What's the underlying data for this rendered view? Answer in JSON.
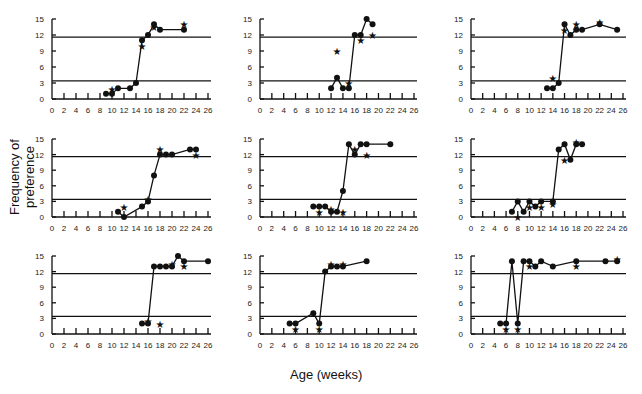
{
  "chart_data": {
    "type": "line",
    "layout": "3x3 small multiples",
    "xlabel": "Age    (weeks)",
    "ylabel": "Frequency  of  preference",
    "x_ticks": [
      0,
      2,
      4,
      6,
      8,
      10,
      12,
      14,
      16,
      18,
      20,
      22,
      24,
      26
    ],
    "y_ticks": [
      0,
      3,
      6,
      9,
      12,
      15
    ],
    "xlim": [
      0,
      26
    ],
    "ylim": [
      0,
      15
    ],
    "reference_lines": [
      11.6,
      3.4
    ],
    "grid": false,
    "panels": [
      {
        "row": 0,
        "col": 0,
        "circles": [
          [
            9,
            1
          ],
          [
            10,
            1
          ],
          [
            11,
            2
          ],
          [
            13,
            2
          ],
          [
            14,
            3
          ],
          [
            15,
            11
          ],
          [
            16,
            12
          ],
          [
            17,
            14
          ],
          [
            18,
            13
          ],
          [
            22,
            13
          ]
        ],
        "stars": [
          [
            10,
            1.8
          ],
          [
            15,
            10
          ],
          [
            17,
            13.5
          ],
          [
            22,
            14
          ]
        ]
      },
      {
        "row": 0,
        "col": 1,
        "circles": [
          [
            12,
            2
          ],
          [
            13,
            4
          ],
          [
            14,
            2
          ],
          [
            15,
            2
          ],
          [
            16,
            12
          ],
          [
            17,
            12
          ],
          [
            18,
            15
          ],
          [
            19,
            14
          ]
        ],
        "stars": [
          [
            13,
            9
          ],
          [
            15,
            3
          ],
          [
            17,
            11
          ],
          [
            19,
            12
          ]
        ]
      },
      {
        "row": 0,
        "col": 2,
        "circles": [
          [
            13,
            2
          ],
          [
            14,
            2
          ],
          [
            15,
            3
          ],
          [
            16,
            14
          ],
          [
            17,
            12
          ],
          [
            18,
            13
          ],
          [
            19,
            13
          ],
          [
            22,
            14
          ],
          [
            25,
            13
          ]
        ],
        "stars": [
          [
            14,
            4
          ],
          [
            16,
            13
          ],
          [
            18,
            14
          ],
          [
            22,
            14.5
          ]
        ]
      },
      {
        "row": 1,
        "col": 0,
        "circles": [
          [
            11,
            1
          ],
          [
            12,
            0
          ],
          [
            15,
            2
          ],
          [
            16,
            3
          ],
          [
            17,
            8
          ],
          [
            18,
            12
          ],
          [
            19,
            12
          ],
          [
            20,
            12
          ],
          [
            23,
            13
          ],
          [
            24,
            13
          ]
        ],
        "stars": [
          [
            12,
            2
          ],
          [
            16,
            3.5
          ],
          [
            18,
            13
          ],
          [
            24,
            12
          ]
        ]
      },
      {
        "row": 1,
        "col": 1,
        "circles": [
          [
            9,
            2
          ],
          [
            10,
            2
          ],
          [
            11,
            2
          ],
          [
            12,
            1
          ],
          [
            13,
            1
          ],
          [
            14,
            5
          ],
          [
            15,
            14
          ],
          [
            16,
            12
          ],
          [
            17,
            14
          ],
          [
            18,
            14
          ],
          [
            22,
            14
          ]
        ],
        "stars": [
          [
            10,
            1
          ],
          [
            12,
            1.5
          ],
          [
            14,
            1
          ],
          [
            16,
            13
          ],
          [
            18,
            12
          ]
        ]
      },
      {
        "row": 1,
        "col": 2,
        "circles": [
          [
            7,
            1
          ],
          [
            8,
            3
          ],
          [
            9,
            1
          ],
          [
            10,
            3
          ],
          [
            11,
            2
          ],
          [
            12,
            3
          ],
          [
            14,
            3
          ],
          [
            15,
            13
          ],
          [
            16,
            14
          ],
          [
            17,
            11
          ],
          [
            18,
            14
          ],
          [
            19,
            14
          ]
        ],
        "stars": [
          [
            8,
            0
          ],
          [
            10,
            2
          ],
          [
            12,
            2
          ],
          [
            14,
            2.5
          ],
          [
            16,
            11
          ],
          [
            18,
            14.5
          ]
        ]
      },
      {
        "row": 2,
        "col": 0,
        "circles": [
          [
            15,
            2
          ],
          [
            16,
            2
          ],
          [
            17,
            13
          ],
          [
            18,
            13
          ],
          [
            19,
            13
          ],
          [
            20,
            13
          ],
          [
            21,
            15
          ],
          [
            22,
            14
          ],
          [
            26,
            14
          ]
        ],
        "stars": [
          [
            16,
            2.5
          ],
          [
            18,
            2
          ],
          [
            20,
            13.5
          ],
          [
            22,
            13
          ]
        ]
      },
      {
        "row": 2,
        "col": 1,
        "circles": [
          [
            5,
            2
          ],
          [
            6,
            2
          ],
          [
            9,
            4
          ],
          [
            10,
            2
          ],
          [
            11,
            12
          ],
          [
            12,
            13
          ],
          [
            13,
            13
          ],
          [
            14,
            13
          ],
          [
            18,
            14
          ]
        ],
        "stars": [
          [
            6,
            1
          ],
          [
            10,
            1
          ],
          [
            12,
            13.5
          ],
          [
            14,
            13.5
          ]
        ]
      },
      {
        "row": 2,
        "col": 2,
        "circles": [
          [
            5,
            2
          ],
          [
            6,
            2
          ],
          [
            7,
            14
          ],
          [
            8,
            2
          ],
          [
            9,
            14
          ],
          [
            10,
            14
          ],
          [
            11,
            13
          ],
          [
            12,
            14
          ],
          [
            14,
            13
          ],
          [
            18,
            14
          ],
          [
            23,
            14
          ],
          [
            25,
            14
          ]
        ],
        "stars": [
          [
            6,
            1
          ],
          [
            8,
            1
          ],
          [
            10,
            13
          ],
          [
            18,
            13
          ],
          [
            25,
            14.5
          ]
        ]
      }
    ]
  },
  "geometry": {
    "cols": [
      {
        "x0": 52,
        "x26": 208
      },
      {
        "x0": 260,
        "x26": 414
      },
      {
        "x0": 471,
        "x26": 623
      }
    ],
    "rows": [
      {
        "ytop": 19,
        "ybot": 99
      },
      {
        "ytop": 139,
        "ybot": 217
      },
      {
        "ytop": 256,
        "ybot": 334
      }
    ]
  }
}
